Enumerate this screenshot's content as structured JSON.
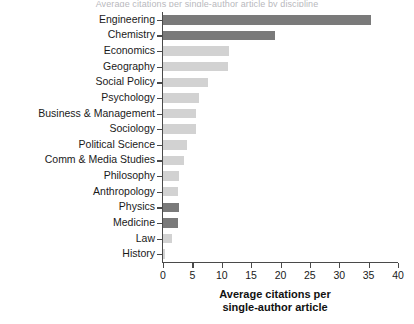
{
  "figure": {
    "title_clipped": "Average citations per single-author article by discipline"
  },
  "chart_data": {
    "type": "bar",
    "orientation": "horizontal",
    "title": "",
    "xlabel_line1": "Average citations per",
    "xlabel_line2": "single-author article",
    "ylabel": "",
    "xlim": [
      0,
      40
    ],
    "xticks": [
      "0",
      "5",
      "10",
      "15",
      "20",
      "25",
      "30",
      "35",
      "40"
    ],
    "xtick_values": [
      0,
      5,
      10,
      15,
      20,
      25,
      30,
      35,
      40
    ],
    "grid": false,
    "legend": "none",
    "colors": {
      "dark_bar": "#7a7a7a",
      "light_bar": "#d2d2d2",
      "axis": "#4a4a4a",
      "text": "#1a1a1a"
    },
    "categories": [
      "Engineering",
      "Chemistry",
      "Economics",
      "Geography",
      "Social Policy",
      "Psychology",
      "Business & Management",
      "Sociology",
      "Political Science",
      "Comm & Media Studies",
      "Philosophy",
      "Anthropology",
      "Physics",
      "Medicine",
      "Law",
      "History"
    ],
    "values": [
      35.4,
      19.0,
      11.3,
      11.0,
      7.7,
      6.2,
      5.7,
      5.6,
      4.0,
      3.5,
      2.7,
      2.6,
      2.7,
      2.6,
      1.6,
      0.3
    ],
    "bar_shades": [
      "dark",
      "dark",
      "light",
      "light",
      "light",
      "light",
      "light",
      "light",
      "light",
      "light",
      "light",
      "light",
      "dark",
      "dark",
      "light",
      "light"
    ]
  }
}
